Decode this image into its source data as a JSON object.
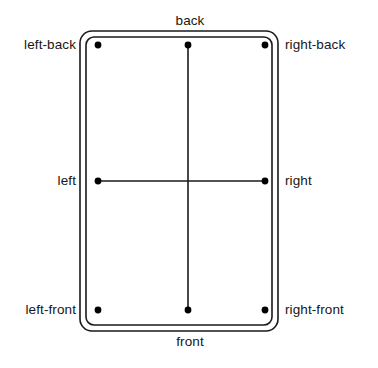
{
  "diagram": {
    "shape_name": "rounded-rectangle-double-border",
    "colors": {
      "stroke": "#1a1a1a",
      "background": "#ffffff",
      "dot": "#000000",
      "text": "#161616"
    },
    "outer_rect": {
      "x": 80,
      "y": 31,
      "width": 198,
      "height": 300,
      "rx": 12
    },
    "inner_rect": {
      "x": 86,
      "y": 37,
      "width": 186,
      "height": 288,
      "rx": 8
    },
    "stroke_width": 1.6,
    "dot_radius": 3.2,
    "points": [
      {
        "id": "left-back",
        "label": "left-back",
        "x": 98,
        "y": 45,
        "label_x": 76,
        "label_y": 45,
        "anchor": "right"
      },
      {
        "id": "back",
        "label": "back",
        "x": 188,
        "y": 45,
        "label_x": 190,
        "label_y": 21,
        "anchor": "center"
      },
      {
        "id": "right-back",
        "label": "right-back",
        "x": 265,
        "y": 45,
        "label_x": 285,
        "label_y": 45,
        "anchor": "left"
      },
      {
        "id": "left",
        "label": "left",
        "x": 98,
        "y": 181,
        "label_x": 76,
        "label_y": 181,
        "anchor": "right"
      },
      {
        "id": "right",
        "label": "right",
        "x": 265,
        "y": 181,
        "label_x": 285,
        "label_y": 181,
        "anchor": "left"
      },
      {
        "id": "left-front",
        "label": "left-front",
        "x": 98,
        "y": 310,
        "label_x": 76,
        "label_y": 310,
        "anchor": "right"
      },
      {
        "id": "front",
        "label": "front",
        "x": 188,
        "y": 310,
        "label_x": 190,
        "label_y": 342,
        "anchor": "center"
      },
      {
        "id": "right-front",
        "label": "right-front",
        "x": 265,
        "y": 310,
        "label_x": 285,
        "label_y": 310,
        "anchor": "left"
      }
    ],
    "connector_lines": [
      {
        "id": "vertical-axis",
        "x1": 188,
        "y1": 45,
        "x2": 188,
        "y2": 310
      },
      {
        "id": "horizontal-axis",
        "x1": 98,
        "y1": 181,
        "x2": 265,
        "y2": 181
      }
    ],
    "labels": {
      "back": "back",
      "front": "front",
      "left": "left",
      "right": "right",
      "left_back": "left-back",
      "right_back": "right-back",
      "left_front": "left-front",
      "right_front": "right-front"
    }
  }
}
